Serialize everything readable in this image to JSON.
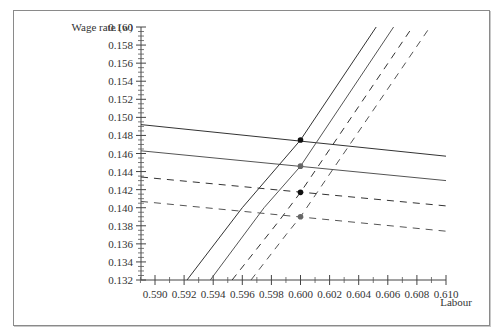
{
  "chart_data": {
    "type": "line",
    "title": "",
    "xlabel": "Labour",
    "ylabel": "Wage rate (w)",
    "ylabel_main": "Wage rate (",
    "ylabel_var": "w",
    "ylabel_close": ")",
    "xlim": [
      0.589,
      0.61
    ],
    "ylim": [
      0.132,
      0.16
    ],
    "x_ticks": [
      "0.590",
      "0.592",
      "0.594",
      "0.596",
      "0.598",
      "0.600",
      "0.602",
      "0.604",
      "0.606",
      "0.608",
      "0.610"
    ],
    "y_ticks": [
      "0.160",
      "0.158",
      "0.156",
      "0.154",
      "0.152",
      "0.150",
      "0.148",
      "0.146",
      "0.144",
      "0.142",
      "0.140",
      "0.138",
      "0.136",
      "0.134",
      "0.132"
    ],
    "grid": false,
    "legend": null,
    "series": [
      {
        "name": "Flat line 1 (solid, dark)",
        "style": "solid",
        "color": "#333333",
        "x": [
          0.5889,
          0.61
        ],
        "y": [
          0.1492,
          0.1457
        ]
      },
      {
        "name": "Flat line 2 (solid, gray)",
        "style": "solid",
        "color": "#555555",
        "x": [
          0.5889,
          0.61
        ],
        "y": [
          0.1463,
          0.143
        ]
      },
      {
        "name": "Flat line 3 (dashed, dark)",
        "style": "dashed",
        "color": "#333333",
        "x": [
          0.5889,
          0.61
        ],
        "y": [
          0.1434,
          0.1402
        ]
      },
      {
        "name": "Flat line 4 (dashed, gray)",
        "style": "dashed",
        "color": "#555555",
        "x": [
          0.5889,
          0.61
        ],
        "y": [
          0.1407,
          0.1374
        ]
      },
      {
        "name": "Steep curve 1 (solid, dark)",
        "style": "solid",
        "color": "#333333",
        "x": [
          0.5922,
          0.596,
          0.6,
          0.6052
        ],
        "y": [
          0.132,
          0.14,
          0.1475,
          0.16
        ]
      },
      {
        "name": "Steep curve 2 (solid, gray)",
        "style": "solid",
        "color": "#555555",
        "x": [
          0.5938,
          0.5975,
          0.6,
          0.6064
        ],
        "y": [
          0.132,
          0.14,
          0.1446,
          0.16
        ]
      },
      {
        "name": "Steep curve 3 (dashed, dark)",
        "style": "dashed",
        "color": "#333333",
        "x": [
          0.5953,
          0.5985,
          0.6,
          0.6077
        ],
        "y": [
          0.132,
          0.1385,
          0.1417,
          0.16
        ]
      },
      {
        "name": "Steep curve 4 (dashed, gray)",
        "style": "dashed",
        "color": "#555555",
        "x": [
          0.5966,
          0.599,
          0.6,
          0.6089
        ],
        "y": [
          0.132,
          0.137,
          0.139,
          0.16
        ]
      }
    ],
    "points": [
      {
        "x": 0.6,
        "y": 0.1475,
        "color": "#111111"
      },
      {
        "x": 0.6,
        "y": 0.1446,
        "color": "#666666"
      },
      {
        "x": 0.6,
        "y": 0.1417,
        "color": "#111111"
      },
      {
        "x": 0.6,
        "y": 0.139,
        "color": "#666666"
      }
    ]
  },
  "layout": {
    "x_px": {
      "min_val": 0.59,
      "min_px": 155,
      "px_per_unit": 14550
    },
    "y_px": {
      "max_val": 0.16,
      "max_px": 27,
      "px_per_unit": 9036
    },
    "axis_x_px": 141,
    "axis_y_px": 280
  }
}
